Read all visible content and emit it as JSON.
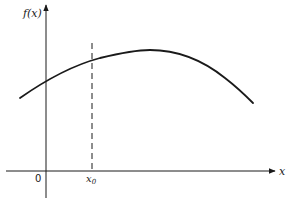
{
  "diagram": {
    "type": "function-plot",
    "y_axis_label": "f(x)",
    "x_axis_label": "x",
    "origin_label": "0",
    "marker_label": "x",
    "marker_subscript": "0",
    "curve_description": "concave-down smooth curve rising to a maximum then falling",
    "marker_line_style": "dashed vertical line at x0"
  },
  "colors": {
    "ink": "#1a1a1a",
    "background": "#ffffff"
  }
}
